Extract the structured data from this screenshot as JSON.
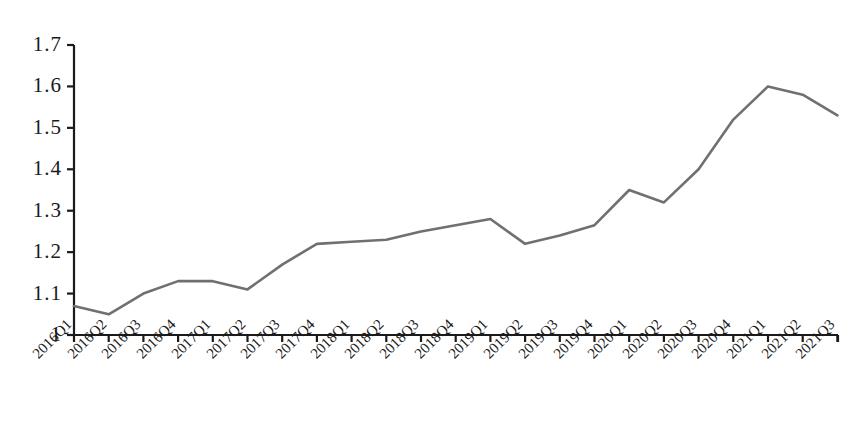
{
  "chart_data": {
    "type": "line",
    "title": "",
    "subtitle": "",
    "xlabel": "",
    "ylabel": "",
    "categories": [
      "2016Q1",
      "2016Q2",
      "2016Q3",
      "2016Q4",
      "2017Q1",
      "2017Q2",
      "2017Q3",
      "2017Q4",
      "2018Q1",
      "2018Q2",
      "2018Q3",
      "2018Q4",
      "2019Q1",
      "2019Q2",
      "2019Q3",
      "2019Q4",
      "2020Q1",
      "2020Q2",
      "2020Q3",
      "2020Q4",
      "2021Q1",
      "2021Q2",
      "2021Q3"
    ],
    "series": [
      {
        "name": "series-1",
        "color": "#707070",
        "values": [
          1.07,
          1.05,
          1.1,
          1.13,
          1.13,
          1.11,
          1.17,
          1.22,
          1.225,
          1.23,
          1.25,
          1.265,
          1.28,
          1.22,
          1.24,
          1.265,
          1.35,
          1.32,
          1.4,
          1.52,
          1.6,
          1.58,
          1.53
        ]
      }
    ],
    "ylim": [
      1.0,
      1.7
    ],
    "yticks": [
      "1",
      "1.1",
      "1.2",
      "1.3",
      "1.4",
      "1.5",
      "1.6",
      "1.7"
    ],
    "ytick_values": [
      1.0,
      1.1,
      1.2,
      1.3,
      1.4,
      1.5,
      1.6,
      1.7
    ],
    "grid": false,
    "legend": "none",
    "axis_color": "#1a1a1a",
    "line_color": "#707070",
    "background": "#ffffff"
  }
}
